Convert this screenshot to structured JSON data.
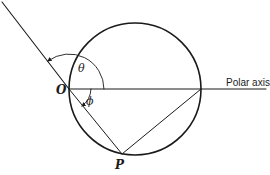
{
  "labels": {
    "origin": "O",
    "point": "P",
    "theta": "θ",
    "phi": "ϕ",
    "polar_axis": "Polar axis"
  },
  "geometry": {
    "origin": [
      69,
      89
    ],
    "circle_center": [
      135,
      89
    ],
    "circle_radius": 66,
    "point_p": [
      122,
      154
    ],
    "axis_end": [
      266,
      89
    ],
    "ray_end": [
      2,
      2
    ]
  },
  "colors": {
    "ink": "#1a1a1a",
    "background": "#ffffff"
  }
}
